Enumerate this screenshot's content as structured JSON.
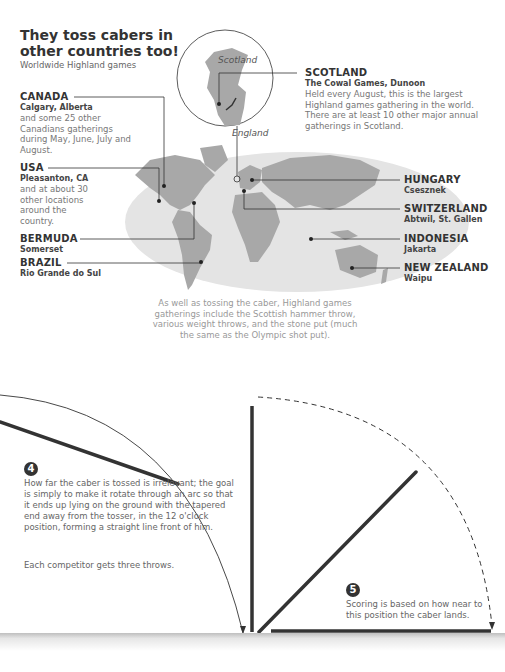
{
  "header": {
    "title": "They toss cabers in other countries too!",
    "subtitle": "Worldwide Highland games"
  },
  "inset": {
    "label_scotland": "Scotland",
    "label_england": "England"
  },
  "locations": [
    {
      "country": "CANADA",
      "city": "Calgary, Alberta",
      "desc": "and some 25 other Canadians gatherings during May, June, July and August."
    },
    {
      "country": "USA",
      "city": "Pleasanton, CA",
      "desc": "and at about 30 other locations around the country."
    },
    {
      "country": "BERMUDA",
      "city": "Somerset",
      "desc": ""
    },
    {
      "country": "BRAZIL",
      "city": "Rio Grande do Sul",
      "desc": ""
    },
    {
      "country": "SCOTLAND",
      "city": "The Cowal Games, Dunoon",
      "desc": "Held every August, this is the largest Highland games gathering in the world. There are at least 10 other major annual gatherings in Scotland."
    },
    {
      "country": "HUNGARY",
      "city": "Csesznek",
      "desc": ""
    },
    {
      "country": "SWITZERLAND",
      "city": "Abtwil, St. Gallen",
      "desc": ""
    },
    {
      "country": "INDONESIA",
      "city": "Jakarta",
      "desc": ""
    },
    {
      "country": "NEW ZEALAND",
      "city": "Waipu",
      "desc": ""
    }
  ],
  "note": "As well as tossing the caber, Highland games gatherings include the Scottish hammer throw, various weight throws, and the stone put (much the same as the Olympic shot put).",
  "steps": [
    {
      "number": "4",
      "text": "How far the caber is tossed is irrelevant; the goal is simply to make it rotate through an arc so that it ends up lying on the ground with the tapered end away from the tosser, in the 12 o'clock position, forming a straight line front of him.",
      "extra": "Each competitor gets three throws."
    },
    {
      "number": "5",
      "text": "Scoring is based on how near to this position the caber lands."
    }
  ],
  "colors": {
    "map_ocean": "#e3e3e3",
    "map_land": "#a9a9a9",
    "line": "#333333",
    "text_muted": "#999999"
  }
}
